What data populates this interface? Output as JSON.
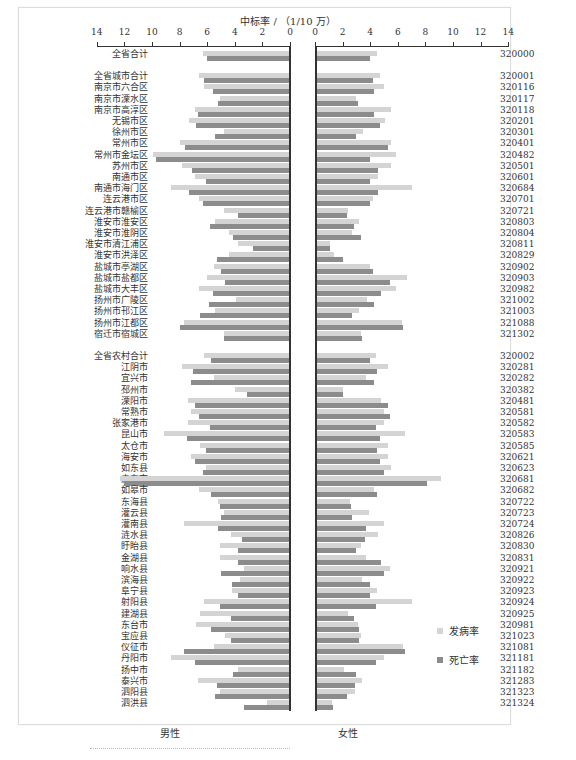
{
  "chart_data": {
    "type": "bar",
    "orientation": "horizontal-butterfly",
    "title": "中标率 / （1/10 万）",
    "xlabel_left": "男性",
    "xlabel_right": "女性",
    "xlim": [
      0,
      14
    ],
    "ticks": [
      0,
      2,
      4,
      6,
      8,
      10,
      12,
      14
    ],
    "grid": false,
    "legend": {
      "position": "right-lower",
      "entries": [
        "发病率",
        "死亡率"
      ]
    },
    "colors": {
      "incidence": "#d4d4d4",
      "mortality": "#8c8c8c"
    },
    "rows": [
      {
        "label": "全省合计",
        "code": "320000",
        "male_inc": 6.3,
        "male_mort": 6.0,
        "female_inc": 4.5,
        "female_mort": 4.0,
        "gap_after": true
      },
      {
        "label": "全省城市合计",
        "code": "320001",
        "male_inc": 6.6,
        "male_mort": 6.2,
        "female_inc": 4.7,
        "female_mort": 4.2
      },
      {
        "label": "南京市六合区",
        "code": "320116",
        "male_inc": 6.2,
        "male_mort": 5.6,
        "female_inc": 5.0,
        "female_mort": 4.3
      },
      {
        "label": "南京市溧水区",
        "code": "320117",
        "male_inc": 5.1,
        "male_mort": 5.2,
        "female_inc": 3.0,
        "female_mort": 3.1
      },
      {
        "label": "南京市高淳区",
        "code": "320118",
        "male_inc": 6.9,
        "male_mort": 6.7,
        "female_inc": 5.5,
        "female_mort": 4.3
      },
      {
        "label": "无锡市区",
        "code": "320201",
        "male_inc": 7.3,
        "male_mort": 6.8,
        "female_inc": 5.1,
        "female_mort": 4.7
      },
      {
        "label": "徐州市区",
        "code": "320301",
        "male_inc": 4.8,
        "male_mort": 5.4,
        "female_inc": 3.5,
        "female_mort": 3.0
      },
      {
        "label": "常州市区",
        "code": "320401",
        "male_inc": 8.0,
        "male_mort": 7.6,
        "female_inc": 5.5,
        "female_mort": 5.3
      },
      {
        "label": "常州市金坛区",
        "code": "320482",
        "male_inc": 9.9,
        "male_mort": 9.7,
        "female_inc": 5.9,
        "female_mort": 4.0
      },
      {
        "label": "苏州市区",
        "code": "320501",
        "male_inc": 7.8,
        "male_mort": 7.1,
        "female_inc": 5.5,
        "female_mort": 4.6
      },
      {
        "label": "南通市区",
        "code": "320601",
        "male_inc": 6.9,
        "male_mort": 6.1,
        "female_inc": 4.6,
        "female_mort": 4.0
      },
      {
        "label": "南通市海门区",
        "code": "320684",
        "male_inc": 8.6,
        "male_mort": 7.3,
        "female_inc": 7.0,
        "female_mort": 4.6
      },
      {
        "label": "连云港市区",
        "code": "320701",
        "male_inc": 6.6,
        "male_mort": 6.3,
        "female_inc": 4.2,
        "female_mort": 4.0
      },
      {
        "label": "连云港市赣榆区",
        "code": "320721",
        "male_inc": 4.8,
        "male_mort": 3.8,
        "female_inc": 2.4,
        "female_mort": 2.3
      },
      {
        "label": "淮安市淮安区",
        "code": "320803",
        "male_inc": 5.4,
        "male_mort": 5.8,
        "female_inc": 3.2,
        "female_mort": 2.8
      },
      {
        "label": "淮安市淮阴区",
        "code": "320804",
        "male_inc": 4.4,
        "male_mort": 4.1,
        "female_inc": 2.7,
        "female_mort": 3.3
      },
      {
        "label": "淮安市清江浦区",
        "code": "320811",
        "male_inc": 3.8,
        "male_mort": 2.7,
        "female_inc": 1.1,
        "female_mort": 1.1
      },
      {
        "label": "淮安市洪泽区",
        "code": "320829",
        "male_inc": 4.4,
        "male_mort": 5.3,
        "female_inc": 1.4,
        "female_mort": 2.0
      },
      {
        "label": "盐城市亭湖区",
        "code": "320902",
        "male_inc": 5.5,
        "male_mort": 5.0,
        "female_inc": 4.0,
        "female_mort": 4.2
      },
      {
        "label": "盐城市盐都区",
        "code": "320903",
        "male_inc": 6.0,
        "male_mort": 4.7,
        "female_inc": 6.7,
        "female_mort": 5.4
      },
      {
        "label": "盐城市大丰区",
        "code": "320982",
        "male_inc": 6.6,
        "male_mort": 5.6,
        "female_inc": 5.9,
        "female_mort": 4.8
      },
      {
        "label": "扬州市广陵区",
        "code": "321002",
        "male_inc": 3.9,
        "male_mort": 5.9,
        "female_inc": 3.8,
        "female_mort": 4.3
      },
      {
        "label": "扬州市邗江区",
        "code": "321003",
        "male_inc": 5.4,
        "male_mort": 6.5,
        "female_inc": 3.2,
        "female_mort": 2.7
      },
      {
        "label": "扬州市江都区",
        "code": "321088",
        "male_inc": 7.7,
        "male_mort": 8.0,
        "female_inc": 6.3,
        "female_mort": 6.4
      },
      {
        "label": "宿迁市宿城区",
        "code": "321302",
        "male_inc": 4.8,
        "male_mort": 4.8,
        "female_inc": 3.3,
        "female_mort": 3.4,
        "gap_after": true
      },
      {
        "label": "全省农村合计",
        "code": "320002",
        "male_inc": 6.2,
        "male_mort": 5.7,
        "female_inc": 4.4,
        "female_mort": 4.0
      },
      {
        "label": "江阴市",
        "code": "320281",
        "male_inc": 7.8,
        "male_mort": 7.0,
        "female_inc": 5.3,
        "female_mort": 4.5
      },
      {
        "label": "宜兴市",
        "code": "320282",
        "male_inc": 5.5,
        "male_mort": 7.2,
        "female_inc": 3.7,
        "female_mort": 4.3
      },
      {
        "label": "邳州市",
        "code": "320382",
        "male_inc": 4.0,
        "male_mort": 3.1,
        "female_inc": 2.0,
        "female_mort": 2.0
      },
      {
        "label": "溧阳市",
        "code": "320481",
        "male_inc": 7.4,
        "male_mort": 6.9,
        "female_inc": 4.8,
        "female_mort": 5.3
      },
      {
        "label": "常熟市",
        "code": "320581",
        "male_inc": 7.2,
        "male_mort": 6.6,
        "female_inc": 5.0,
        "female_mort": 5.4
      },
      {
        "label": "张家港市",
        "code": "320582",
        "male_inc": 7.4,
        "male_mort": 5.8,
        "female_inc": 5.0,
        "female_mort": 4.4
      },
      {
        "label": "昆山市",
        "code": "320583",
        "male_inc": 9.1,
        "male_mort": 7.5,
        "female_inc": 6.5,
        "female_mort": 4.7
      },
      {
        "label": "太仓市",
        "code": "320585",
        "male_inc": 6.5,
        "male_mort": 6.1,
        "female_inc": 5.3,
        "female_mort": 4.5
      },
      {
        "label": "海安市",
        "code": "320621",
        "male_inc": 7.2,
        "male_mort": 6.9,
        "female_inc": 5.3,
        "female_mort": 4.7
      },
      {
        "label": "如东县",
        "code": "320623",
        "male_inc": 6.1,
        "male_mort": 6.3,
        "female_inc": 5.5,
        "female_mort": 5.0
      },
      {
        "label": "启东市",
        "code": "320681",
        "male_inc": 12.3,
        "male_mort": 12.0,
        "female_inc": 9.1,
        "female_mort": 8.1
      },
      {
        "label": "如皋市",
        "code": "320682",
        "male_inc": 6.6,
        "male_mort": 5.7,
        "female_inc": 4.3,
        "female_mort": 4.5
      },
      {
        "label": "东海县",
        "code": "320722",
        "male_inc": 5.2,
        "male_mort": 5.1,
        "female_inc": 2.5,
        "female_mort": 2.6
      },
      {
        "label": "灌云县",
        "code": "320723",
        "male_inc": 4.8,
        "male_mort": 5.0,
        "female_inc": 3.9,
        "female_mort": 2.7
      },
      {
        "label": "灌南县",
        "code": "320724",
        "male_inc": 7.7,
        "male_mort": 5.2,
        "female_inc": 5.0,
        "female_mort": 3.7
      },
      {
        "label": "涟水县",
        "code": "320826",
        "male_inc": 4.3,
        "male_mort": 3.5,
        "female_inc": 4.6,
        "female_mort": 3.6
      },
      {
        "label": "盱眙县",
        "code": "320830",
        "male_inc": 5.1,
        "male_mort": 3.8,
        "female_inc": 3.3,
        "female_mort": 3.0
      },
      {
        "label": "金湖县",
        "code": "320831",
        "male_inc": 5.1,
        "male_mort": 3.8,
        "female_inc": 3.7,
        "female_mort": 4.8
      },
      {
        "label": "响水县",
        "code": "320921",
        "male_inc": 3.3,
        "male_mort": 5.0,
        "female_inc": 5.4,
        "female_mort": 5.0
      },
      {
        "label": "滨海县",
        "code": "320922",
        "male_inc": 3.6,
        "male_mort": 4.2,
        "female_inc": 3.4,
        "female_mort": 4.0
      },
      {
        "label": "阜宁县",
        "code": "320923",
        "male_inc": 4.2,
        "male_mort": 3.8,
        "female_inc": 4.5,
        "female_mort": 4.0
      },
      {
        "label": "射阳县",
        "code": "320924",
        "male_inc": 6.2,
        "male_mort": 5.1,
        "female_inc": 7.0,
        "female_mort": 4.4
      },
      {
        "label": "建湖县",
        "code": "320925",
        "male_inc": 6.5,
        "male_mort": 4.3,
        "female_inc": 2.4,
        "female_mort": 2.8
      },
      {
        "label": "东台市",
        "code": "320981",
        "male_inc": 6.8,
        "male_mort": 5.7,
        "female_inc": 3.1,
        "female_mort": 3.2
      },
      {
        "label": "宝应县",
        "code": "321023",
        "male_inc": 4.7,
        "male_mort": 4.3,
        "female_inc": 3.3,
        "female_mort": 3.2
      },
      {
        "label": "仪征市",
        "code": "321081",
        "male_inc": 5.5,
        "male_mort": 7.7,
        "female_inc": 6.4,
        "female_mort": 6.5
      },
      {
        "label": "丹阳市",
        "code": "321181",
        "male_inc": 8.6,
        "male_mort": 6.9,
        "female_inc": 5.0,
        "female_mort": 4.4
      },
      {
        "label": "扬中市",
        "code": "321182",
        "male_inc": 3.8,
        "male_mort": 4.1,
        "female_inc": 2.1,
        "female_mort": 3.0
      },
      {
        "label": "泰兴市",
        "code": "321283",
        "male_inc": 6.7,
        "male_mort": 5.3,
        "female_inc": 3.4,
        "female_mort": 2.9
      },
      {
        "label": "泗阳县",
        "code": "321323",
        "male_inc": 5.1,
        "male_mort": 5.4,
        "female_inc": 2.9,
        "female_mort": 2.3
      },
      {
        "label": "泗洪县",
        "code": "321324",
        "male_inc": 1.7,
        "male_mort": 3.3,
        "female_inc": 1.2,
        "female_mort": 1.3
      }
    ]
  },
  "header": {
    "title": "中标率 / （1/10 万）"
  },
  "axis": {
    "tick_labels_left": [
      "14",
      "12",
      "10",
      "8",
      "6",
      "4",
      "2",
      "0"
    ],
    "tick_labels_right": [
      "0",
      "2",
      "4",
      "6",
      "8",
      "10",
      "12",
      "14"
    ]
  },
  "legend": {
    "incidence_label": "发病率",
    "mortality_label": "死亡率"
  },
  "footer": {
    "male_label": "男性",
    "female_label": "女性"
  }
}
